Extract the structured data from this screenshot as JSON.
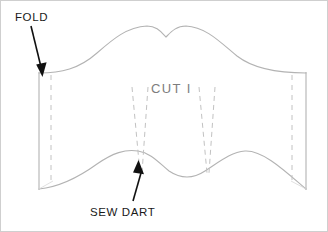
{
  "figure": {
    "width": 328,
    "height": 232,
    "background_color": "#ffffff",
    "border_color": "#cfcfcf"
  },
  "labels": {
    "fold": "FOLD",
    "sew_dart": "SEW DART",
    "cut_one": "CUT I"
  },
  "colors": {
    "pattern_outline": "#b3b3b3",
    "dashed_line": "#c2c2c2",
    "arrow": "#111111",
    "label_text": "#1a1a1a",
    "cut_text": "#7d7d7d"
  },
  "annotations": [
    {
      "name": "fold-arrow",
      "label": "FOLD",
      "points_to": "left-edge-fold-line",
      "direction": "down-right"
    },
    {
      "name": "sew-dart-arrow",
      "label": "SEW DART",
      "points_to": "left-dart-stitch-lines",
      "direction": "up-left"
    }
  ],
  "pattern_geometry": {
    "left_edge_x": 38,
    "right_edge_x": 305,
    "left_seam_dash_x": 50,
    "right_seam_dash_x": 291,
    "top_edge_y": 72,
    "bottom_edge_y": 188,
    "top_curve_description": "Wavy upper edge with two peaks and a central V notch",
    "bottom_curve_description": "Wavy lower edge with two humps and a central dip",
    "darts": [
      {
        "name": "left-dart",
        "apex_x": 137,
        "base_x_left": 131,
        "base_x_right": 147
      },
      {
        "name": "right-dart",
        "apex_x": 208,
        "base_x_left": 198,
        "base_x_right": 214
      }
    ]
  }
}
